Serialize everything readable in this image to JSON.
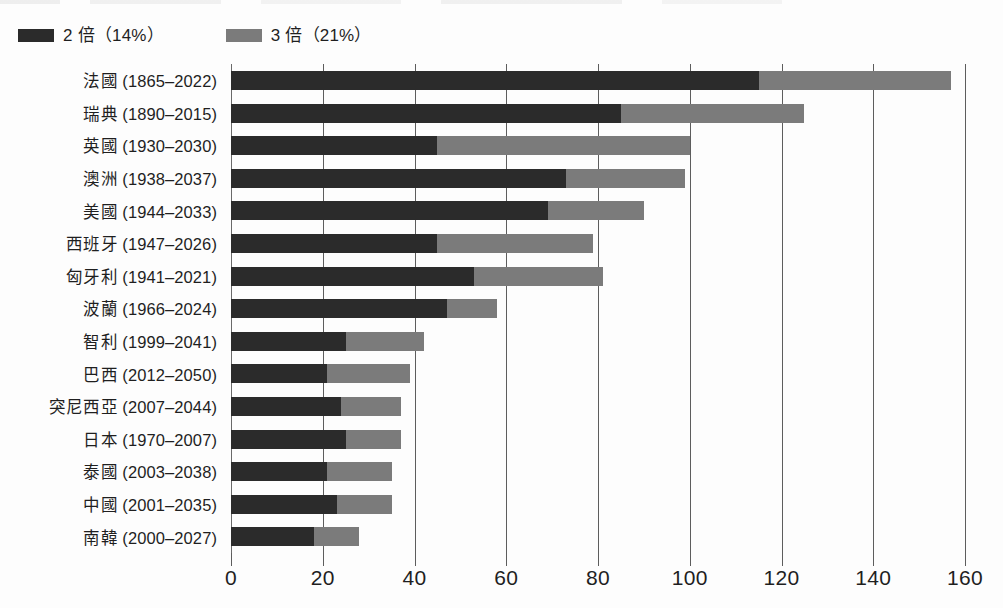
{
  "legend": {
    "items": [
      {
        "label": "2 倍（14%）",
        "swatch_color": "#2b2b2b",
        "name": "series-2x"
      },
      {
        "label": "3 倍（21%）",
        "swatch_color": "#7b7b7b",
        "name": "series-3x"
      }
    ]
  },
  "axis": {
    "x_ticks": [
      "0",
      "20",
      "40",
      "60",
      "80",
      "100",
      "120",
      "140",
      "160"
    ]
  },
  "chart_data": {
    "type": "bar",
    "orientation": "horizontal",
    "stacked": true,
    "title": "",
    "xlabel": "",
    "ylabel": "",
    "xlim": [
      0,
      160
    ],
    "xticks": [
      0,
      20,
      40,
      60,
      80,
      100,
      120,
      140,
      160
    ],
    "grid": "vertical",
    "legend_position": "top-left",
    "categories": [
      "法國 (1865–2022)",
      "瑞典 (1890–2015)",
      "英國 (1930–2030)",
      "澳洲 (1938–2037)",
      "美國 (1944–2033)",
      "西班牙 (1947–2026)",
      "匈牙利 (1941–2021)",
      "波蘭 (1966–2024)",
      "智利 (1999–2041)",
      "巴西 (2012–2050)",
      "突尼西亞 (2007–2044)",
      "日本 (1970–2007)",
      "泰國 (2003–2038)",
      "中國 (2001–2035)",
      "南韓 (2000–2027)"
    ],
    "series": [
      {
        "name": "2 倍（14%）",
        "color": "#2b2b2b",
        "values": [
          115,
          85,
          45,
          73,
          69,
          45,
          53,
          47,
          25,
          21,
          24,
          25,
          21,
          23,
          18
        ]
      },
      {
        "name": "3 倍（21%）",
        "color": "#7b7b7b",
        "values": [
          42,
          40,
          55,
          26,
          21,
          34,
          28,
          11,
          17,
          18,
          13,
          12,
          14,
          12,
          10
        ]
      }
    ],
    "totals": [
      157,
      125,
      100,
      99,
      90,
      79,
      81,
      58,
      42,
      39,
      37,
      37,
      35,
      35,
      28
    ]
  }
}
